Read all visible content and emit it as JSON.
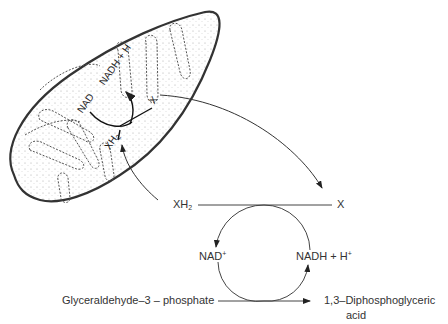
{
  "diagram": {
    "title": "",
    "mitochondrion_labels": {
      "nad": "NAD",
      "nadh": "NADH",
      "plus": "+",
      "h": "H",
      "x": "X",
      "xh2_base": "XH",
      "xh2_sub": "2"
    },
    "cycle": {
      "xh2_base": "XH",
      "xh2_sub": "2",
      "x": "X",
      "nad_base": "NAD",
      "nad_sup": "+",
      "nadh": "NADH + H",
      "nadh_sup": "+",
      "substrate": "Glyceraldehyde–3 – phosphate",
      "product_line1": "1,3–Diphosphoglyceric",
      "product_line2": "acid"
    },
    "colors": {
      "ink": "#333333",
      "background": "#ffffff"
    }
  }
}
